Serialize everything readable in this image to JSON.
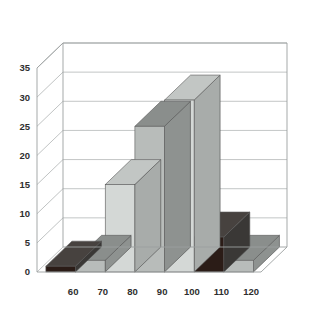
{
  "chart_data": {
    "type": "bar",
    "title": "",
    "subtitle": "",
    "xlabel": "",
    "ylabel": "",
    "categories": [
      "60",
      "70",
      "80",
      "90",
      "100",
      "110",
      "120"
    ],
    "values": [
      1,
      2,
      15,
      25,
      29.5,
      6,
      2
    ],
    "series": [
      {
        "name": "Frequency",
        "values": [
          1,
          2,
          15,
          25,
          29.5,
          6,
          2
        ]
      }
    ],
    "ylim": [
      0,
      35
    ],
    "yticks": [
      0,
      5,
      10,
      15,
      20,
      25,
      30,
      35
    ],
    "ytick_labels": [
      "0",
      "5",
      "10",
      "15",
      "20",
      "25",
      "30",
      "35"
    ],
    "xtick_labels": [
      "60",
      "70",
      "80",
      "90",
      "100",
      "110",
      "120"
    ],
    "grid": true,
    "legend": false,
    "legend_position": "none",
    "annotations": [],
    "style": "3d-bars",
    "bar_colors": [
      "#2b1c17",
      "#b8bcba",
      "#d4d8d6",
      "#b8bcba",
      "#d4d8d6",
      "#2b1c17",
      "#b8bcba"
    ],
    "colors": {
      "dark_bar": "#2b1c17",
      "mid_gray_bar": "#b8bcba",
      "light_gray_bar": "#d4d8d6",
      "dark_side": "#3a3836",
      "mid_side": "#8e9290",
      "light_side": "#a8acaa",
      "dark_top": "#47423f",
      "mid_top": "#8a8e8c",
      "light_top": "#c2c6c4",
      "gridline": "#b4b8b8",
      "axis_line": "#9b9f9f",
      "floor": "#ffffff",
      "back_wall": "#ffffff",
      "label_text": "#2e2e2e",
      "background": "#ffffff"
    }
  },
  "labels": {
    "y": [
      "0",
      "5",
      "10",
      "15",
      "20",
      "25",
      "30",
      "35"
    ],
    "x": [
      "60",
      "70",
      "80",
      "90",
      "100",
      "110",
      "120"
    ]
  }
}
